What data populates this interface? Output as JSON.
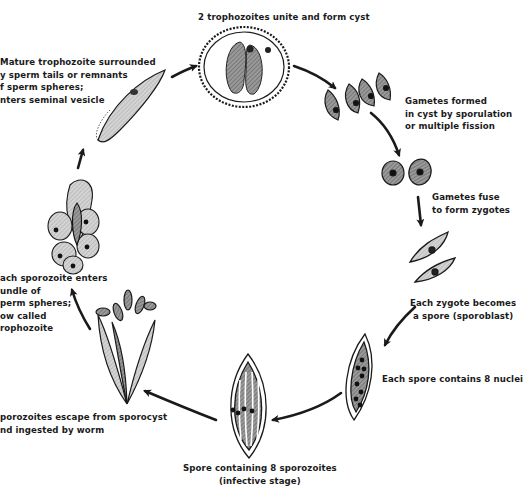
{
  "diagram": {
    "type": "life-cycle",
    "colors": {
      "ink": "#1a1a1a",
      "shade": "#8a8a8a",
      "light_shade": "#c8c8c8",
      "background": "#ffffff"
    },
    "stages": [
      {
        "id": "cyst",
        "label": "2 trophozoites unite and form cyst"
      },
      {
        "id": "gametes",
        "label_lines": [
          "Gametes formed",
          "in cyst by  sporulation",
          "or multiple fission"
        ]
      },
      {
        "id": "zygotes",
        "label_lines": [
          "Gametes fuse",
          "to form zygotes"
        ]
      },
      {
        "id": "sporoblast",
        "label_lines": [
          "Each zygote becomes",
          "a spore (sporoblast)"
        ]
      },
      {
        "id": "spore-nuclei",
        "label": "Each spore contains 8 nuclei"
      },
      {
        "id": "spore-sporozoites",
        "label_lines": [
          "Spore containing 8 sporozoites",
          "(infective stage)"
        ]
      },
      {
        "id": "escape",
        "label_lines": [
          "porozoites escape from sporocyst",
          "nd ingested by worm"
        ]
      },
      {
        "id": "enter-bundle",
        "label_lines": [
          "ach sporozoite enters",
          "undle of",
          "perm spheres;",
          "ow called",
          "rophozoite"
        ]
      },
      {
        "id": "mature",
        "label_lines": [
          "Mature trophozoite surrounded",
          "y sperm tails or remnants",
          "f sperm  spheres;",
          "nters seminal vesicle"
        ]
      }
    ]
  }
}
